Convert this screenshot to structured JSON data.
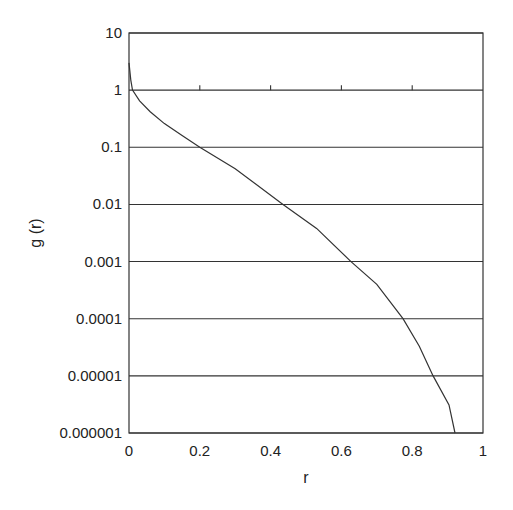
{
  "chart_data": {
    "type": "line",
    "title": "",
    "xlabel": "r",
    "ylabel": "g (r)",
    "xlim": [
      0,
      1
    ],
    "ylim": [
      1e-06,
      10
    ],
    "yscale": "log",
    "grid": "horizontal lines at each decade",
    "legend": "none",
    "x_ticks": [
      "0",
      "0.2",
      "0.4",
      "0.6",
      "0.8",
      "1"
    ],
    "y_ticks": [
      "10",
      "1",
      "0.1",
      "0.01",
      "0.001",
      "0.0001",
      "0.00001",
      "0.000001"
    ],
    "series": [
      {
        "name": "g(r)",
        "x": [
          0.0,
          0.005,
          0.01,
          0.03,
          0.06,
          0.1,
          0.15,
          0.2,
          0.3,
          0.435,
          0.53,
          0.627,
          0.7,
          0.774,
          0.82,
          0.859,
          0.904,
          0.921
        ],
        "y": [
          3.0,
          1.5,
          1.0,
          0.65,
          0.42,
          0.26,
          0.16,
          0.1,
          0.042,
          0.01,
          0.0038,
          0.001,
          0.0004,
          0.0001,
          3.3e-05,
          1e-05,
          3.1e-06,
          1e-06
        ]
      }
    ]
  }
}
